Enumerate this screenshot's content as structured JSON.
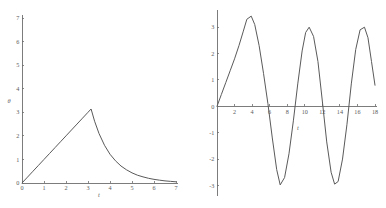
{
  "figure": {
    "background_color": "#ffffff",
    "curve_color": "#5a5a5a",
    "axis_color": "#6e6e6e",
    "label_color": "#5c5c5c",
    "panel_count": 2
  },
  "chart_data": [
    {
      "type": "line",
      "id": "left-panel",
      "title": "",
      "xlabel": "t",
      "ylabel": "θ",
      "xlim": [
        0,
        7
      ],
      "ylim": [
        0,
        7
      ],
      "xticks": [
        0,
        1,
        2,
        3,
        4,
        5,
        6,
        7
      ],
      "xticklabels": [
        "0",
        "1",
        "2",
        "3",
        "4",
        "5",
        "6",
        "7"
      ],
      "yticks": [
        0,
        1,
        2,
        3,
        4,
        5,
        6,
        7
      ],
      "yticklabels": [
        "0",
        "1",
        "2",
        "3",
        "4",
        "5",
        "6",
        "7"
      ],
      "grid": false,
      "legend": "none",
      "annotations": [
        "linear rise to cusp at t=3.14, then exponential decay"
      ],
      "series": [
        {
          "name": "theta(t)",
          "x": [
            0.0,
            0.25,
            0.5,
            0.75,
            1.0,
            1.25,
            1.5,
            1.75,
            2.0,
            2.25,
            2.5,
            2.75,
            3.0,
            3.14,
            3.3,
            3.5,
            3.75,
            4.0,
            4.25,
            4.5,
            4.75,
            5.0,
            5.25,
            5.5,
            5.75,
            6.0,
            6.25,
            6.5,
            6.75,
            7.0
          ],
          "y": [
            0.0,
            0.25,
            0.5,
            0.75,
            1.0,
            1.25,
            1.5,
            1.75,
            2.0,
            2.25,
            2.5,
            2.75,
            3.0,
            3.14,
            2.62,
            2.1,
            1.6,
            1.22,
            0.94,
            0.72,
            0.56,
            0.43,
            0.33,
            0.26,
            0.2,
            0.155,
            0.12,
            0.09,
            0.07,
            0.05
          ]
        }
      ]
    },
    {
      "type": "line",
      "id": "right-panel",
      "title": "",
      "xlabel": "t",
      "ylabel": "",
      "xlim": [
        0,
        18
      ],
      "ylim": [
        -3.4,
        3.5
      ],
      "xticks": [
        2,
        4,
        6,
        8,
        10,
        12,
        14,
        16,
        18
      ],
      "xticklabels": [
        "2",
        "4",
        "6",
        "8",
        "10",
        "12",
        "14",
        "16",
        "18"
      ],
      "yticks": [
        -3,
        -2,
        -1,
        0,
        1,
        2,
        3
      ],
      "yticklabels": [
        "-3",
        "-2",
        "-1",
        "0",
        "1",
        "2",
        "3"
      ],
      "grid": false,
      "legend": "none",
      "annotations": [
        "rise to first peak 3.4 near t=4, then sustained oscillation of amplitude 3"
      ],
      "series": [
        {
          "name": "oscillation(t)",
          "x": [
            0.0,
            0.5,
            1.0,
            1.5,
            2.0,
            2.5,
            3.0,
            3.4,
            3.9,
            4.3,
            4.8,
            5.3,
            5.8,
            6.3,
            6.8,
            7.2,
            7.7,
            8.2,
            8.7,
            9.2,
            9.7,
            10.1,
            10.5,
            11.0,
            11.5,
            12.0,
            12.5,
            13.0,
            13.4,
            13.8,
            14.3,
            14.8,
            15.3,
            15.8,
            16.3,
            16.8,
            17.2,
            17.6,
            18.0
          ],
          "y": [
            0.0,
            0.45,
            0.9,
            1.35,
            1.8,
            2.3,
            2.85,
            3.3,
            3.42,
            3.1,
            2.3,
            1.25,
            0.1,
            -1.2,
            -2.4,
            -2.98,
            -2.7,
            -1.8,
            -0.55,
            0.85,
            2.1,
            2.8,
            3.0,
            2.65,
            1.7,
            0.2,
            -1.35,
            -2.5,
            -2.95,
            -2.85,
            -2.0,
            -0.7,
            0.85,
            2.15,
            2.9,
            3.0,
            2.6,
            1.7,
            0.8
          ]
        }
      ]
    }
  ]
}
